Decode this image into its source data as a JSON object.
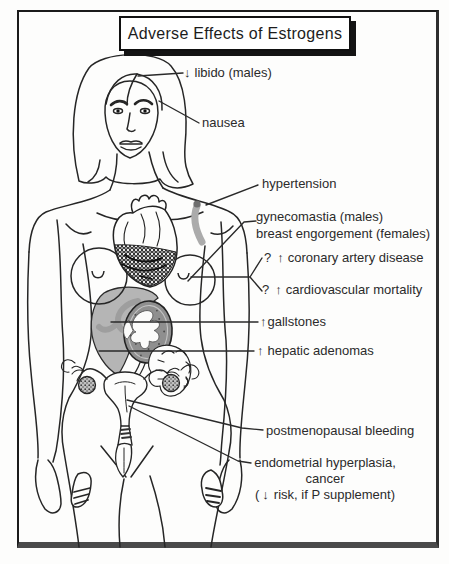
{
  "title": "Adverse Effects of Estrogens",
  "colors": {
    "ink": "#262626",
    "liver_gray": "#b5b5b5",
    "organ_gray": "#8f8f8f",
    "band_gray": "#ababab",
    "paper": "#fdfdfc"
  },
  "labels": {
    "libido_arrow": "↓",
    "libido_text": "libido (males)",
    "nausea": "nausea",
    "hypertension": "hypertension",
    "gynecomastia": "gynecomastia (males)",
    "breast_engorgement": "breast engorgement (females)",
    "coronary_q": "?",
    "coronary_arrow": "↑",
    "coronary_text": "coronary artery disease",
    "cardio_q": "?",
    "cardio_arrow": "↑",
    "cardio_text": "cardiovascular mortality",
    "gallstones_arrow": "↑",
    "gallstones_text": "gallstones",
    "hepatic_arrow": "↑",
    "hepatic_text": "hepatic adenomas",
    "postmenopausal": "postmenopausal bleeding",
    "endometrial_line1": "endometrial hyperplasia,",
    "endometrial_line2": "cancer",
    "endometrial_line3_pre": "(",
    "endometrial_line3_arrow": "↓",
    "endometrial_line3_text": "risk, if P supplement)"
  }
}
